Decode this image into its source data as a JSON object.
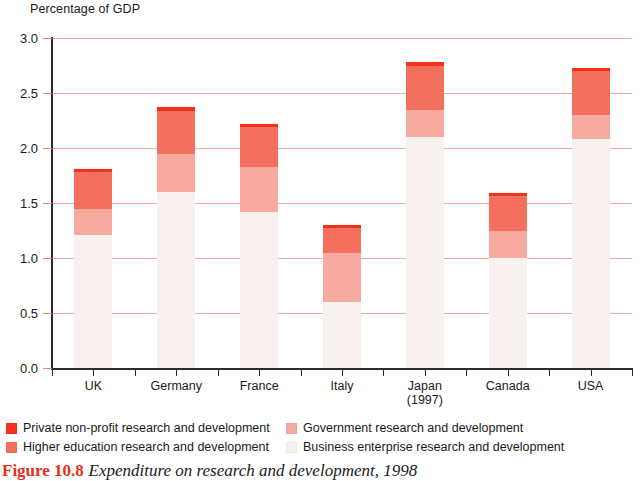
{
  "chart_data": {
    "type": "bar",
    "subtype": "stacked",
    "title": "Expenditure on research and development, 1998",
    "figure_number": "Figure 10.8",
    "ylabel": "Percentage of GDP",
    "xlabel": "",
    "ylim": [
      0,
      3.0
    ],
    "ytick_values": [
      0.0,
      0.5,
      1.0,
      1.5,
      2.0,
      2.5,
      3.0
    ],
    "ytick_labels": [
      "0.0",
      "0.5",
      "1.0",
      "1.5",
      "2.0",
      "2.5",
      "3.0"
    ],
    "grid": true,
    "legend_position": "below-axis",
    "categories": [
      "UK",
      "Germany",
      "France",
      "Italy",
      "Japan",
      "Canada",
      "USA"
    ],
    "category_sublabels": [
      "",
      "",
      "",
      "",
      "(1997)",
      "",
      ""
    ],
    "series": [
      {
        "name": "Business enterprise research and development",
        "color": "#f7f1f0",
        "values": [
          1.21,
          1.6,
          1.42,
          0.6,
          2.1,
          1.0,
          2.08
        ]
      },
      {
        "name": "Government research and development",
        "color": "#f7aaa0",
        "values": [
          0.24,
          0.35,
          0.41,
          0.45,
          0.25,
          0.25,
          0.22
        ]
      },
      {
        "name": "Higher education research and development",
        "color": "#f4705e",
        "values": [
          0.33,
          0.39,
          0.36,
          0.22,
          0.4,
          0.31,
          0.4
        ]
      },
      {
        "name": "Private non-profit research and development",
        "color": "#f4311d",
        "values": [
          0.03,
          0.03,
          0.03,
          0.03,
          0.03,
          0.03,
          0.03
        ]
      }
    ],
    "totals": [
      1.81,
      2.37,
      2.22,
      1.3,
      2.78,
      1.59,
      2.73
    ]
  },
  "legend": {
    "items": [
      {
        "label": "Private non-profit research and development",
        "color": "#f4311d"
      },
      {
        "label": "Higher education research and development",
        "color": "#f4705e"
      },
      {
        "label": "Government research and development",
        "color": "#f7aaa0"
      },
      {
        "label": "Business enterprise research and development",
        "color": "#f7f1f0"
      }
    ]
  },
  "caption": {
    "figure_number": "Figure 10.8",
    "text": "Expenditure on research and development, 1998"
  },
  "colors": {
    "gridline": "#f3a9a3",
    "axis": "#2b2b2b",
    "figure_number": "#e8301c"
  }
}
